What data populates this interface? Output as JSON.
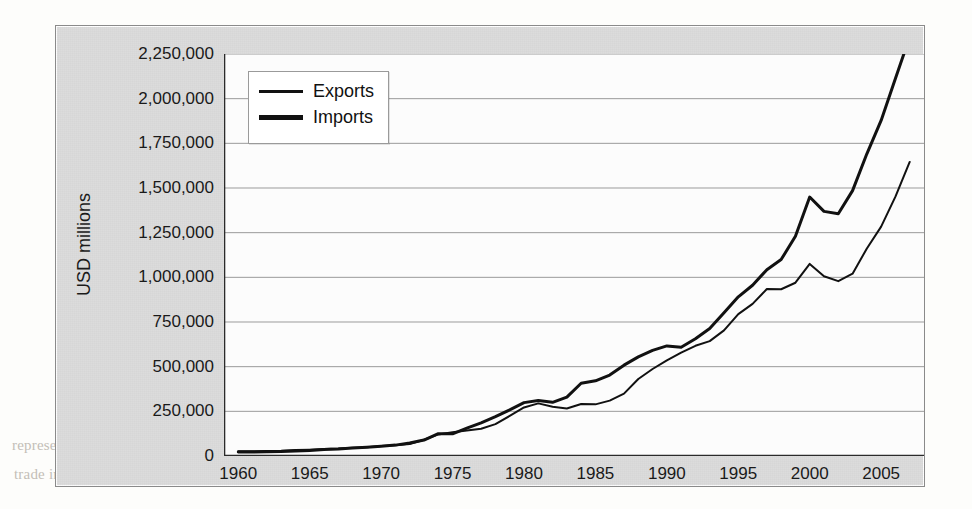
{
  "page": {
    "ghost_text": [
      {
        "text": "imports of USD 2,169,487 million (2007 data), resulting in a trade deficit",
        "x": 175,
        "y": 26,
        "cls": "ghost-line"
      },
      {
        "text": "of USD 700. This balance would be trivial were it not for the U.S.",
        "x": 178,
        "y": 52,
        "cls": "ghost-line"
      },
      {
        "text": "issues of currency by USD 300 billion in financing the deficit and the",
        "x": 175,
        "y": 80,
        "cls": "ghost-line"
      },
      {
        "text": "from 1997 and trading volumes in goods and services around the world",
        "x": 175,
        "y": 106,
        "cls": "ghost-line"
      },
      {
        "text": "Trends in International Trade",
        "x": 300,
        "y": 183,
        "cls": "ghost-head"
      },
      {
        "text": "The World Trade Organization (WTO) publishes figures on",
        "x": 210,
        "y": 222,
        "cls": "ghost-line"
      },
      {
        "text": "recent data (see Exhibit 1.5) indicate that in the years since 2000",
        "x": 180,
        "y": 254,
        "cls": "ghost-line"
      },
      {
        "text": "an annual rate of 5.5 percent, while global merchandise trade has",
        "x": 182,
        "y": 286,
        "cls": "ghost-line"
      },
      {
        "text": "percent, a slightly faster pace than that of world output growth.",
        "x": 186,
        "y": 315,
        "cls": "ghost-line"
      },
      {
        "text": "The largest traded goods—manufactures—grew by 8 percent as",
        "x": 196,
        "y": 347,
        "cls": "ghost-line"
      },
      {
        "text": "agricultural products and fuels, have slowed. Global trade in commercial",
        "x": 182,
        "y": 378,
        "cls": "ghost-bold"
      },
      {
        "text": "represented about 19 percent of all global trade flows in 2007. The total value",
        "x": 12,
        "y": 437,
        "cls": "ghost-line"
      },
      {
        "text": "trade in 2007 and exports and imports of goods. In addition, economic",
        "x": 14,
        "y": 466,
        "cls": "ghost-line"
      }
    ]
  },
  "chart_data": {
    "type": "line",
    "title": "",
    "xlabel": "",
    "ylabel": "USD millions",
    "xlim": [
      1959,
      2008
    ],
    "ylim": [
      0,
      2250000
    ],
    "grid": true,
    "legend_position": "top-left",
    "y_ticks": [
      {
        "value": 2250000,
        "label": "2,250,000"
      },
      {
        "value": 2000000,
        "label": "2,000,000"
      },
      {
        "value": 1750000,
        "label": "1,750,000"
      },
      {
        "value": 1500000,
        "label": "1,500,000"
      },
      {
        "value": 1250000,
        "label": "1,250,000"
      },
      {
        "value": 1000000,
        "label": "1,000,000"
      },
      {
        "value": 750000,
        "label": "750,000"
      },
      {
        "value": 500000,
        "label": "500,000"
      },
      {
        "value": 250000,
        "label": "250,000"
      },
      {
        "value": 0,
        "label": "0"
      }
    ],
    "x_ticks": [
      {
        "value": 1960,
        "label": "1960"
      },
      {
        "value": 1965,
        "label": "1965"
      },
      {
        "value": 1970,
        "label": "1970"
      },
      {
        "value": 1975,
        "label": "1975"
      },
      {
        "value": 1980,
        "label": "1980"
      },
      {
        "value": 1985,
        "label": "1985"
      },
      {
        "value": 1990,
        "label": "1990"
      },
      {
        "value": 1995,
        "label": "1995"
      },
      {
        "value": 2000,
        "label": "2000"
      },
      {
        "value": 2005,
        "label": "2005"
      }
    ],
    "x": [
      1960,
      1961,
      1962,
      1963,
      1964,
      1965,
      1966,
      1967,
      1968,
      1969,
      1970,
      1971,
      1972,
      1973,
      1974,
      1975,
      1976,
      1977,
      1978,
      1979,
      1980,
      1981,
      1982,
      1983,
      1984,
      1985,
      1986,
      1987,
      1988,
      1989,
      1990,
      1991,
      1992,
      1993,
      1994,
      1995,
      1996,
      1997,
      1998,
      1999,
      2000,
      2001,
      2002,
      2003,
      2004,
      2005,
      2006,
      2007
    ],
    "series": [
      {
        "name": "Exports",
        "line_width": 2,
        "color": "#111111",
        "values": [
          25940,
          26403,
          27722,
          29620,
          33341,
          35285,
          38926,
          41333,
          45543,
          49220,
          56640,
          59677,
          67222,
          91242,
          120897,
          132585,
          142716,
          152301,
          178428,
          224131,
          271834,
          294398,
          275236,
          266106,
          291094,
          289070,
          310033,
          348869,
          431149,
          487003,
          535233,
          578344,
          616882,
          642863,
          703254,
          794387,
          851602,
          934453,
          933174,
          969867,
          1075321,
          1005654,
          978706,
          1020403,
          1161549,
          1283753,
          1451685,
          1645726
        ],
        "end_value_label": "1,160,000"
      },
      {
        "name": "Imports",
        "line_width": 3,
        "color": "#111111",
        "values": [
          22432,
          22208,
          24352,
          25410,
          27319,
          30621,
          36043,
          38684,
          45293,
          48960,
          54386,
          60979,
          72665,
          89342,
          125190,
          124228,
          155562,
          185119,
          220123,
          258048,
          298673,
          310402,
          300627,
          329607,
          407083,
          420944,
          452918,
          508362,
          554555,
          591020,
          616097,
          609082,
          656094,
          713174,
          801747,
          890771,
          955667,
          1042725,
          1099314,
          1230215,
          1449377,
          1369220,
          1355843,
          1485184,
          1691426,
          1878191,
          2112506,
          2345984
        ],
        "end_value_label": "1,975,000"
      }
    ]
  },
  "legend": {
    "entries": [
      {
        "label": "Exports",
        "swatch": "thin"
      },
      {
        "label": "Imports",
        "swatch": "thick"
      }
    ]
  }
}
